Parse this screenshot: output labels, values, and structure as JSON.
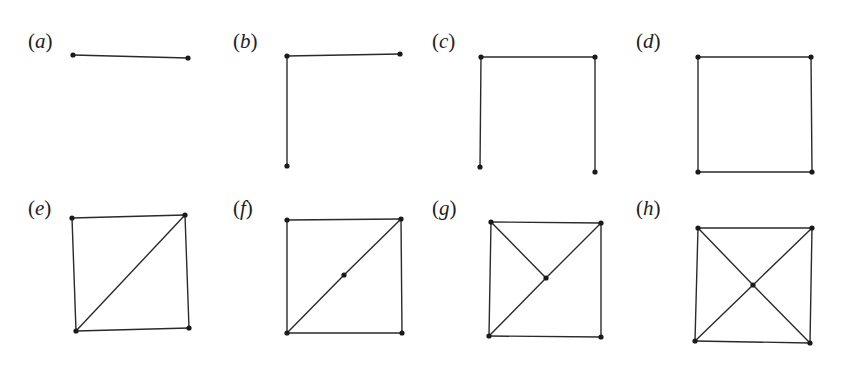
{
  "figure": {
    "colors": {
      "background": "#ffffff",
      "edge": "#2a2a2a",
      "vertex": "#1a1a1a",
      "label": "#222222"
    },
    "panels": [
      {
        "id": "a",
        "label_open": "(",
        "label_var": "a",
        "label_close": ")",
        "label_pos": [
          28,
          31
        ],
        "vertices": [
          [
            73,
            55
          ],
          [
            188,
            58
          ]
        ],
        "edges": [
          [
            0,
            1
          ]
        ]
      },
      {
        "id": "b",
        "label_open": "(",
        "label_var": "b",
        "label_close": ")",
        "label_pos": [
          233,
          31
        ],
        "vertices": [
          [
            287,
            56
          ],
          [
            400,
            54
          ],
          [
            287,
            166
          ]
        ],
        "edges": [
          [
            0,
            1
          ],
          [
            0,
            2
          ]
        ]
      },
      {
        "id": "c",
        "label_open": "(",
        "label_var": "c",
        "label_close": ")",
        "label_pos": [
          432,
          31
        ],
        "vertices": [
          [
            481,
            57
          ],
          [
            595,
            57
          ],
          [
            480,
            167
          ],
          [
            595,
            172
          ]
        ],
        "edges": [
          [
            0,
            1
          ],
          [
            0,
            2
          ],
          [
            1,
            3
          ]
        ]
      },
      {
        "id": "d",
        "label_open": "(",
        "label_var": "d",
        "label_close": ")",
        "label_pos": [
          636,
          31
        ],
        "vertices": [
          [
            698,
            57
          ],
          [
            811,
            57
          ],
          [
            698,
            172
          ],
          [
            812,
            172
          ]
        ],
        "edges": [
          [
            0,
            1
          ],
          [
            0,
            2
          ],
          [
            1,
            3
          ],
          [
            2,
            3
          ]
        ]
      },
      {
        "id": "e",
        "label_open": "(",
        "label_var": "e",
        "label_close": ")",
        "label_pos": [
          28,
          198
        ],
        "vertices": [
          [
            72,
            218
          ],
          [
            185,
            215
          ],
          [
            76,
            331
          ],
          [
            189,
            328
          ]
        ],
        "edges": [
          [
            0,
            1
          ],
          [
            0,
            2
          ],
          [
            1,
            3
          ],
          [
            2,
            3
          ],
          [
            2,
            1
          ]
        ]
      },
      {
        "id": "f",
        "label_open": "(",
        "label_var": "f",
        "label_close": ")",
        "label_pos": [
          233,
          198
        ],
        "vertices": [
          [
            287,
            220
          ],
          [
            401,
            219
          ],
          [
            287,
            333
          ],
          [
            402,
            333
          ],
          [
            344,
            275
          ]
        ],
        "edges": [
          [
            0,
            1
          ],
          [
            0,
            2
          ],
          [
            1,
            3
          ],
          [
            2,
            3
          ],
          [
            2,
            4
          ],
          [
            4,
            1
          ]
        ]
      },
      {
        "id": "g",
        "label_open": "(",
        "label_var": "g",
        "label_close": ")",
        "label_pos": [
          432,
          198
        ],
        "vertices": [
          [
            491,
            222
          ],
          [
            601,
            223
          ],
          [
            489,
            336
          ],
          [
            601,
            337
          ],
          [
            546,
            278
          ]
        ],
        "edges": [
          [
            0,
            1
          ],
          [
            0,
            2
          ],
          [
            1,
            3
          ],
          [
            2,
            3
          ],
          [
            2,
            4
          ],
          [
            4,
            1
          ],
          [
            0,
            4
          ]
        ]
      },
      {
        "id": "h",
        "label_open": "(",
        "label_var": "h",
        "label_close": ")",
        "label_pos": [
          636,
          198
        ],
        "vertices": [
          [
            698,
            228
          ],
          [
            812,
            228
          ],
          [
            695,
            341
          ],
          [
            810,
            343
          ],
          [
            753,
            285
          ]
        ],
        "edges": [
          [
            0,
            1
          ],
          [
            0,
            2
          ],
          [
            1,
            3
          ],
          [
            2,
            3
          ],
          [
            2,
            4
          ],
          [
            4,
            1
          ],
          [
            0,
            4
          ],
          [
            4,
            3
          ]
        ]
      }
    ]
  }
}
